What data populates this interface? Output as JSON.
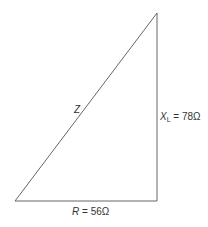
{
  "diagram": {
    "type": "impedance-triangle",
    "line_color": "#555555",
    "vertices": {
      "top": [
        157,
        13
      ],
      "bottom_right": [
        157,
        201
      ],
      "bottom_left": [
        15,
        201
      ]
    },
    "labels": {
      "hypotenuse": {
        "symbol": "Z"
      },
      "vertical": {
        "symbol": "X",
        "subscript": "L",
        "equals": " = ",
        "value": "78Ω"
      },
      "horizontal": {
        "symbol": "R",
        "equals": " = ",
        "value": "56Ω"
      }
    }
  }
}
